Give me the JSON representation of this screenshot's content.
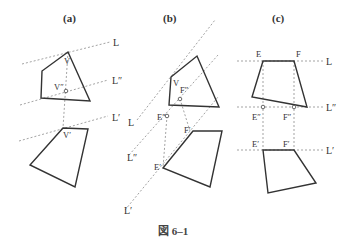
{
  "figure": {
    "caption": "図 6–1",
    "panels": [
      {
        "id": "a",
        "title": "(a)",
        "labels": {
          "L": "L",
          "Lpp": "L″",
          "Lp": "L′",
          "V": "V",
          "Vpp": "V″",
          "Vp": "V′"
        }
      },
      {
        "id": "b",
        "title": "(b)",
        "labels": {
          "L": "L",
          "Lpp": "L″",
          "Lp": "L′",
          "V": "V",
          "Fpp": "F″",
          "Epp": "E″",
          "Fp": "F′",
          "Ep": "E′"
        }
      },
      {
        "id": "c",
        "title": "(c)",
        "labels": {
          "E": "E",
          "F": "F",
          "L": "L",
          "Epp": "E″",
          "Fpp": "F″",
          "Lpp": "L″",
          "Ep": "E′",
          "Fp": "F′",
          "Lp": "L′"
        }
      }
    ]
  },
  "colors": {
    "stroke": "#333333",
    "dashed": "#999999",
    "background": "#ffffff"
  }
}
